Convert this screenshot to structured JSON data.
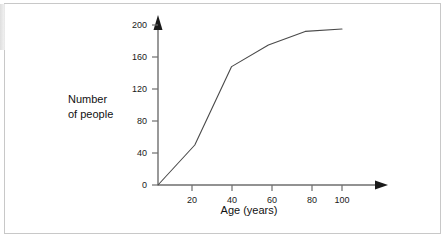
{
  "chart_data": {
    "type": "line",
    "title": "",
    "xlabel": "Age (years)",
    "ylabel_line1": "Number",
    "ylabel_line2": "of people",
    "x": [
      0,
      20,
      40,
      60,
      80,
      100
    ],
    "values": [
      0,
      50,
      148,
      175,
      192,
      195
    ],
    "series": [
      {
        "name": "Number of people",
        "values": [
          0,
          50,
          148,
          175,
          192,
          195
        ]
      }
    ],
    "xlim": [
      0,
      110
    ],
    "ylim": [
      0,
      210
    ],
    "xticks": [
      20,
      40,
      60,
      80,
      100
    ],
    "yticks": [
      0,
      40,
      80,
      120,
      160,
      200
    ],
    "xtick_labels": [
      "20",
      "40",
      "60",
      "80",
      "100"
    ],
    "ytick_labels": [
      "0",
      "40",
      "80",
      "120",
      "160",
      "200"
    ],
    "grid": false,
    "legend": "none",
    "line_color": "#4a4a4a",
    "axis_color": "#6e6e6e",
    "text_color": "#111111"
  },
  "figure": {
    "border_color": "#c8c8c8",
    "background": "#ffffff"
  }
}
